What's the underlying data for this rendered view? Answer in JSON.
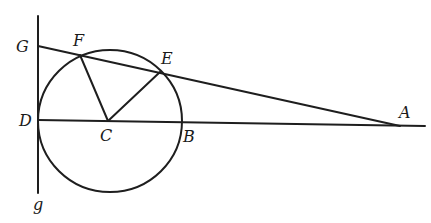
{
  "diagram": {
    "type": "geometry",
    "colors": {
      "stroke": "#1e1e1e",
      "background": "#ffffff"
    },
    "labels": {
      "G": "G",
      "F": "F",
      "E": "E",
      "D": "D",
      "C": "C",
      "B": "B",
      "A": "A",
      "g": "g"
    },
    "points": {
      "G": [
        39,
        46
      ],
      "F": [
        80,
        55
      ],
      "E": [
        160,
        72
      ],
      "D": [
        38,
        120
      ],
      "C": [
        109,
        120
      ],
      "B": [
        182,
        121
      ],
      "A": [
        400,
        126
      ]
    },
    "circle": {
      "center": "C",
      "rx": 72,
      "ry": 71
    },
    "segments": [
      [
        "G",
        "A"
      ],
      [
        "D",
        "A"
      ],
      [
        "F",
        "C"
      ],
      [
        "E",
        "C"
      ],
      [
        "tangent-top",
        "g"
      ]
    ]
  }
}
